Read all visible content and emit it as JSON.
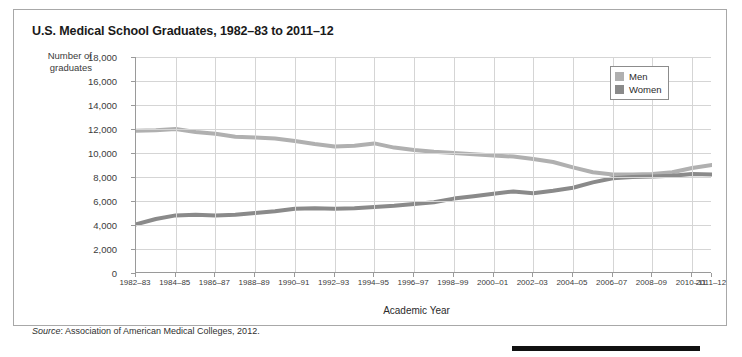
{
  "figure": {
    "title": "U.S. Medical School Graduates, 1982–83 to 2011–12",
    "source_label": "Source",
    "source_text": ": Association of American Medical Colleges, 2012."
  },
  "colors": {
    "men_line": "#b0b0b0",
    "women_line": "#8a8a8a",
    "grid": "#d5d5d5",
    "axis": "#9a9a9a",
    "frame": "#a8a8a8",
    "text": "#2b2b2b",
    "bottom_bar": "#111111"
  },
  "legend": {
    "position": "top-right",
    "entries": [
      {
        "label": "Men",
        "color": "#b0b0b0"
      },
      {
        "label": "Women",
        "color": "#8a8a8a"
      }
    ]
  },
  "chart_data": {
    "type": "line",
    "title": "U.S. Medical School Graduates, 1982–83 to 2011–12",
    "xlabel": "Academic Year",
    "ylabel": "Number of graduates",
    "ylim": [
      0,
      18000
    ],
    "ytick_values": [
      0,
      2000,
      4000,
      6000,
      8000,
      10000,
      12000,
      14000,
      16000,
      18000
    ],
    "ytick_labels": [
      "0",
      "2,000",
      "4,000",
      "6,000",
      "8,000",
      "10,000",
      "12,000",
      "14,000",
      "16,000",
      "18,000"
    ],
    "grid": true,
    "categories": [
      "1982–83",
      "1983–84",
      "1984–85",
      "1985–86",
      "1986–87",
      "1987–88",
      "1988–89",
      "1989–90",
      "1990–91",
      "1991–92",
      "1992–93",
      "1993–94",
      "1994–95",
      "1995–96",
      "1996–97",
      "1997–98",
      "1998–99",
      "1999–2000",
      "2000–01",
      "2001–02",
      "2002–03",
      "2003–04",
      "2004–05",
      "2005–06",
      "2006–07",
      "2007–08",
      "2008–09",
      "2009–10",
      "2010–11",
      "2011–12"
    ],
    "xtick_labels": [
      "1982–83",
      "1984–85",
      "1986–87",
      "1988–89",
      "1990–91",
      "1992–93",
      "1994–95",
      "1996–97",
      "1998–99",
      "2000–01",
      "2002–03",
      "2004–05",
      "2006–07",
      "2008–09",
      "2010–11",
      "2011–12"
    ],
    "xtick_indices": [
      0,
      2,
      4,
      6,
      8,
      10,
      12,
      14,
      16,
      18,
      20,
      22,
      24,
      26,
      28,
      29
    ],
    "series": [
      {
        "name": "Men",
        "color": "#b0b0b0",
        "values": [
          11850,
          11900,
          12000,
          11750,
          11600,
          11350,
          11300,
          11200,
          11000,
          10750,
          10550,
          10600,
          10800,
          10450,
          10250,
          10100,
          10000,
          9900,
          9800,
          9700,
          9500,
          9250,
          8800,
          8400,
          8200,
          8200,
          8250,
          8400,
          8750,
          9000
        ]
      },
      {
        "name": "Women",
        "color": "#8a8a8a",
        "values": [
          4050,
          4500,
          4800,
          4850,
          4800,
          4850,
          5000,
          5150,
          5350,
          5400,
          5350,
          5400,
          5500,
          5600,
          5750,
          5900,
          6200,
          6400,
          6600,
          6800,
          6650,
          6850,
          7100,
          7550,
          7900,
          8000,
          8050,
          8100,
          8250,
          8200
        ]
      }
    ]
  }
}
